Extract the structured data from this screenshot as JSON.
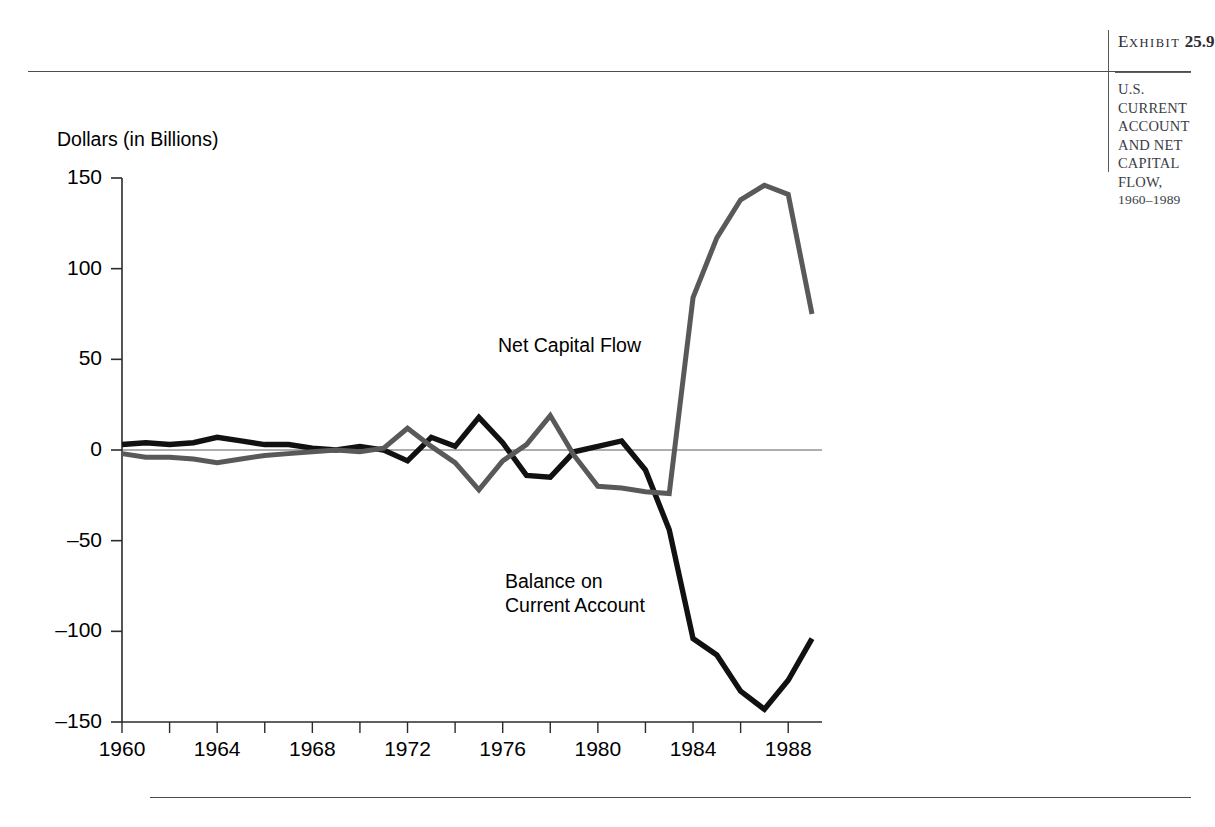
{
  "exhibit": {
    "label_prefix": "E",
    "label_word": "XHIBIT",
    "label_number": "25.9",
    "title_line1": "U.S. CURRENT",
    "title_line2": "ACCOUNT AND NET",
    "title_line3": "CAPITAL FLOW,",
    "title_years": "1960–1989"
  },
  "source_note": "",
  "chart_data": {
    "type": "line",
    "xlabel": "",
    "ylabel": "Dollars (in Billions)",
    "xlim": [
      1960,
      1989
    ],
    "ylim": [
      -150,
      150
    ],
    "yticks": [
      150,
      100,
      50,
      0,
      -50,
      -100,
      -150
    ],
    "ytick_labels": [
      "150",
      "100",
      "50",
      "0",
      "–50",
      "–100",
      "–150"
    ],
    "xticks": [
      1960,
      1962,
      1964,
      1966,
      1968,
      1970,
      1972,
      1974,
      1976,
      1978,
      1980,
      1982,
      1984,
      1986,
      1988
    ],
    "xtick_labels": [
      "1960",
      "",
      "1964",
      "",
      "1968",
      "",
      "1972",
      "",
      "1976",
      "",
      "1980",
      "",
      "1984",
      "",
      "1988"
    ],
    "grid": false,
    "legend_position": "inline-annotations",
    "zero_line": true,
    "x": [
      1960,
      1961,
      1962,
      1963,
      1964,
      1965,
      1966,
      1967,
      1968,
      1969,
      1970,
      1971,
      1972,
      1973,
      1974,
      1975,
      1976,
      1977,
      1978,
      1979,
      1980,
      1981,
      1982,
      1983,
      1984,
      1985,
      1986,
      1987,
      1988,
      1989
    ],
    "series": [
      {
        "name": "Balance on Current Account",
        "color": "#111111",
        "values": [
          3,
          4,
          3,
          4,
          7,
          5,
          3,
          3,
          1,
          0,
          2,
          0,
          -6,
          7,
          2,
          18,
          4,
          -14,
          -15,
          -1,
          2,
          5,
          -11,
          -44,
          -104,
          -113,
          -133,
          -143,
          -127,
          -104
        ]
      },
      {
        "name": "Net Capital Flow",
        "color": "#595959",
        "values": [
          -2,
          -4,
          -4,
          -5,
          -7,
          -5,
          -3,
          -2,
          -1,
          0,
          -1,
          1,
          12,
          2,
          -7,
          -22,
          -6,
          3,
          19,
          -3,
          -20,
          -21,
          -23,
          -24,
          84,
          117,
          138,
          146,
          141,
          75
        ]
      }
    ],
    "annotations": [
      {
        "text": "Net Capital Flow",
        "x": 1978.5,
        "y": 62
      },
      {
        "text": "Balance on Current Account",
        "x": 1979,
        "y": -68
      }
    ]
  },
  "axis": {
    "y_title": "Dollars (in Billions)"
  }
}
